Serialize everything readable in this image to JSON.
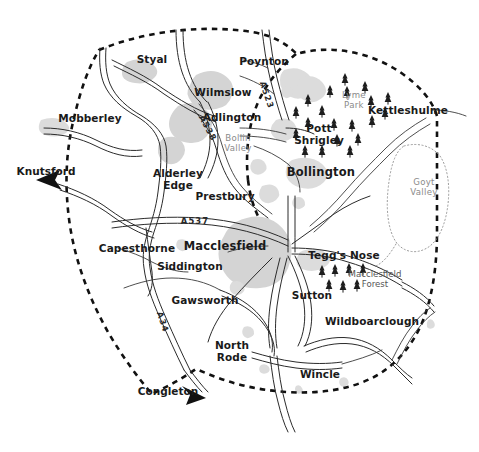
{
  "map": {
    "title": "Macclesfield and East Cheshire Area Map",
    "width": 479,
    "height": 452,
    "background_color": "#ffffff",
    "style": "hand-drawn sketch map",
    "colors": {
      "urban_fill": "#d4d4d4",
      "road_stroke": "#2b2b2b",
      "boundary_stroke": "#111111",
      "area_label": "#8a8a8a",
      "town_label": "#1a1a1a",
      "tree_symbol": "#1e1e1e",
      "valley_outline": "#9a9a9a"
    }
  },
  "settlements": [
    {
      "name": "Styal",
      "x": 152,
      "y": 60,
      "style": "town",
      "anchor": "middle"
    },
    {
      "name": "Poynton",
      "x": 264,
      "y": 62,
      "style": "town",
      "anchor": "middle"
    },
    {
      "name": "Wilmslow",
      "x": 223,
      "y": 93,
      "style": "town",
      "anchor": "middle"
    },
    {
      "name": "Mobberley",
      "x": 90,
      "y": 119,
      "style": "town",
      "anchor": "middle"
    },
    {
      "name": "Adlington",
      "x": 232,
      "y": 118,
      "style": "town",
      "anchor": "middle"
    },
    {
      "name": "Kettleshulme",
      "x": 408,
      "y": 111,
      "style": "town",
      "anchor": "middle"
    },
    {
      "name": "Bollington",
      "x": 321,
      "y": 172,
      "style": "major",
      "anchor": "middle"
    },
    {
      "name": "Alderley Edge",
      "x": 178,
      "y": 180,
      "style": "town",
      "anchor": "middle",
      "lines": [
        "Alderley",
        "Edge"
      ]
    },
    {
      "name": "Prestbury",
      "x": 225,
      "y": 197,
      "style": "town",
      "anchor": "middle"
    },
    {
      "name": "Pott Shrigley",
      "x": 319,
      "y": 135,
      "style": "town",
      "anchor": "middle",
      "lines": [
        "Pott",
        "Shrigley"
      ]
    },
    {
      "name": "Macclesfield",
      "x": 225,
      "y": 246,
      "style": "major",
      "anchor": "middle"
    },
    {
      "name": "Capesthorne",
      "x": 137,
      "y": 249,
      "style": "town",
      "anchor": "middle"
    },
    {
      "name": "Siddington",
      "x": 190,
      "y": 267,
      "style": "town",
      "anchor": "middle"
    },
    {
      "name": "Gawsworth",
      "x": 205,
      "y": 301,
      "style": "town",
      "anchor": "middle"
    },
    {
      "name": "Tegg's Nose",
      "x": 344,
      "y": 256,
      "style": "town",
      "anchor": "middle"
    },
    {
      "name": "Sutton",
      "x": 312,
      "y": 296,
      "style": "town",
      "anchor": "middle"
    },
    {
      "name": "Wildboarclough",
      "x": 372,
      "y": 322,
      "style": "town",
      "anchor": "middle"
    },
    {
      "name": "North Rode",
      "x": 232,
      "y": 352,
      "style": "town",
      "anchor": "middle",
      "lines": [
        "North",
        "Rode"
      ]
    },
    {
      "name": "Wincle",
      "x": 320,
      "y": 375,
      "style": "town",
      "anchor": "middle"
    }
  ],
  "external_destinations": [
    {
      "name": "Knutsford",
      "x": 46,
      "y": 172,
      "arrow_direction": "southwest"
    },
    {
      "name": "Congleton",
      "x": 168,
      "y": 392,
      "arrow_direction": "southeast"
    }
  ],
  "areas": [
    {
      "name": "Bollin Valley",
      "x": 238,
      "y": 143,
      "lines": [
        "Bollin",
        "Valley"
      ],
      "style": "area"
    },
    {
      "name": "Lyme Park",
      "x": 354,
      "y": 100,
      "lines": [
        "Lyme",
        "Park"
      ],
      "style": "area"
    },
    {
      "name": "Goyt Valley",
      "x": 424,
      "y": 187,
      "lines": [
        "Goyt",
        "Valley"
      ],
      "style": "area"
    },
    {
      "name": "Macclesfield Forest",
      "x": 375,
      "y": 279,
      "lines": [
        "Macclesfield",
        "Forest"
      ],
      "style": "forest"
    }
  ],
  "roads": [
    {
      "name": "A523",
      "x": 267,
      "y": 95,
      "rotation": 72
    },
    {
      "name": "A538",
      "x": 208,
      "y": 128,
      "rotation": 62
    },
    {
      "name": "A537",
      "x": 195,
      "y": 221,
      "rotation": 0
    },
    {
      "name": "A34",
      "x": 163,
      "y": 322,
      "rotation": 72
    }
  ],
  "legend_features": {
    "boundary_type": "dashed district boundary",
    "forest_symbol": "conifer tree",
    "urban_symbol": "grey built-up area"
  }
}
